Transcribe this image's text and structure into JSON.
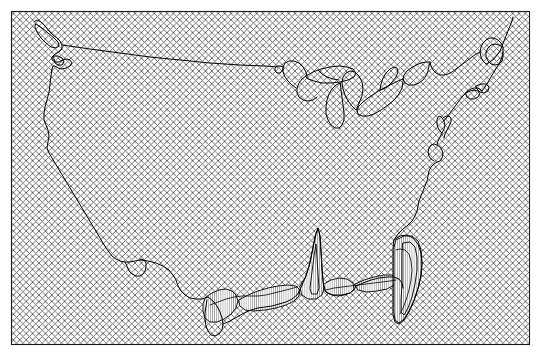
{
  "figure": {
    "name": "contiguous-united-states-outline-map",
    "width": 542,
    "height": 357,
    "background_color": "#ffffff",
    "title": "",
    "caption": "",
    "axis_labels": [],
    "tick_labels": [],
    "legend_entries": [],
    "annotations": [],
    "visible_text": []
  },
  "frame": {
    "name": "map-border-frame",
    "x": 11,
    "y": 11,
    "width": 519,
    "height": 334,
    "stroke_color": "#1a1a1a",
    "stroke_width": 1.1,
    "fill": "none"
  },
  "hatch": {
    "name": "diagonal-cross-hatch-fill",
    "description": "fine 45-degree cross-hatch covering map interior",
    "period_px": 6.4,
    "stroke_color": "#555555",
    "stroke_width": 0.85,
    "angles_deg": [
      45,
      135
    ],
    "background_color": "#ffffff"
  },
  "coastline": {
    "name": "national-boundary-outline",
    "stroke_color": "#000000",
    "stroke_width": 1.0,
    "fill": "none"
  },
  "coastal_polygons": {
    "name": "gulf-coast-and-florida-detail-polygons",
    "fill_color": "#ffffff",
    "stripe_color": "#3a3a3a",
    "stripe_width": 0.45,
    "stripe_angle_deg": 90,
    "stroke_color": "#000000",
    "stroke_width": 0.9
  },
  "regions": [
    {
      "name": "pacific-northwest-puget-sound",
      "label": "Pacific Northwest"
    },
    {
      "name": "california-coast",
      "label": "California Coast"
    },
    {
      "name": "rio-grande-border",
      "label": "Rio Grande Border"
    },
    {
      "name": "gulf-coast",
      "label": "Gulf Coast"
    },
    {
      "name": "florida-peninsula",
      "label": "Florida Peninsula"
    },
    {
      "name": "atlantic-coast",
      "label": "Atlantic Coast"
    },
    {
      "name": "maine-saint-lawrence",
      "label": "Maine and St. Lawrence"
    },
    {
      "name": "great-lakes",
      "label": "Great Lakes"
    },
    {
      "name": "canada-border-49th-parallel",
      "label": "49th Parallel Border"
    }
  ],
  "chart_data": {
    "type": "map",
    "title": "",
    "xlabel": "",
    "ylabel": "",
    "projection": "conic-like continental US",
    "grid": false,
    "legend": false,
    "series": [
      {
        "name": "national-outline",
        "style": "stroke-only",
        "paths": {
          "main_outline": "M 36,32 L 38,30 L 41,32 L 44,36 L 47,40 L 50,44 L 53,46 L 56,47 L 59,48 L 62,51 L 63,55 L 61,58 L 58,60 L 56,63 L 57,66 L 60,67 L 63,66 L 66,64 L 69,63 L 72,64 L 74,66 L 73,69 L 70,71 L 67,72 L 64,72 L 62,71 L 60,70 L 58,71 L 57,74 L 57,78 L 56,84 L 55,92 L 54,100 L 53,108 L 51,114 L 49,119 L 48,124 L 48,129 L 50,133 L 52,137 L 53,142 L 52,147 L 51,152 L 52,157 L 54,161 L 57,165 L 60,169 L 63,173 L 66,177 L 69,181 L 72,185 L 75,189 L 78,193 L 81,197 L 84,201 L 87,205 L 90,209 L 93,213 L 96,217 L 99,221 L 102,225 L 105,229 L 108,233 L 111,237 L 114,241 L 117,245 L 120,249 L 123,253 L 126,257 L 129,260 L 133,262 L 137,263 L 141,262 L 145,260 L 149,259 L 152,260 L 155,262 L 157,265 L 159,269 L 161,273 L 163,277 L 166,280 L 170,282 L 174,283 L 178,284 L 182,286 L 185,289 L 187,293 L 189,297 L 191,301 L 194,304 L 198,306 L 202,307 L 206,307 L 210,306 L 214,304 L 218,302 L 222,300 L 226,298 L 230,297 L 234,296 L 238,296 L 242,297 L 246,298 L 250,299 L 254,299 L 258,298 L 262,297 L 266,295 L 270,293 L 274,291 L 278,289 L 282,287 L 286,285 L 290,283 L 294,281 L 298,279 L 302,277 L 306,275 L 310,273 L 314,271 L 318,270 L 322,270 L 326,271 L 330,272 L 334,274 L 338,276 L 342,278 L 346,280 L 350,281 L 354,282 L 358,282 L 362,281 L 366,280 L 370,278 L 374,276 L 378,274 L 382,272 L 386,270 L 390,268 L 394,266 L 398,264 L 402,261 L 406,258 L 410,254 L 413,250 L 416,246 L 418,242 L 420,238 L 421,234 L 422,230 L 422,226 L 421,222 L 420,218 L 419,214 L 419,210 L 420,206 L 422,202 L 424,198 L 426,194 L 428,190 L 430,186 L 432,182 L 434,178 L 436,174 L 438,170 L 440,166 L 442,162 L 444,158 L 446,154 L 448,150 L 450,146 L 452,142 L 454,138 L 456,134 L 458,130 L 460,126 L 462,122 L 464,118 L 466,114 L 468,110 L 470,106 L 472,102 L 474,98 L 476,94 L 478,90 L 480,86 L 482,82 L 484,78 L 486,74 L 488,70",
          "canada_border": "M 62,51 L 120,57 L 180,62 L 240,66 L 280,68"
        }
      },
      {
        "name": "great-lakes",
        "style": "stroke-only"
      },
      {
        "name": "gulf-coast-barrier-polygons",
        "style": "white-fill-vertical-stripe"
      },
      {
        "name": "florida-detail-polygons",
        "style": "white-fill-vertical-stripe"
      }
    ]
  }
}
